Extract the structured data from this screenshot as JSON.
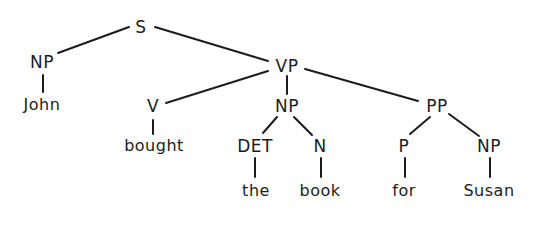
{
  "diagram": {
    "type": "parse-tree",
    "nodes": [
      {
        "id": "S",
        "label": "S",
        "x": 141,
        "y": 27,
        "kind": "category"
      },
      {
        "id": "NP1",
        "label": "NP",
        "x": 42,
        "y": 62,
        "kind": "category"
      },
      {
        "id": "John",
        "label": "John",
        "x": 42,
        "y": 105,
        "kind": "word"
      },
      {
        "id": "VP",
        "label": "VP",
        "x": 287,
        "y": 66,
        "kind": "category"
      },
      {
        "id": "V",
        "label": "V",
        "x": 153,
        "y": 106,
        "kind": "category"
      },
      {
        "id": "bought",
        "label": "bought",
        "x": 154,
        "y": 146,
        "kind": "word"
      },
      {
        "id": "NP2",
        "label": "NP",
        "x": 287,
        "y": 106,
        "kind": "category"
      },
      {
        "id": "DET",
        "label": "DET",
        "x": 255,
        "y": 146,
        "kind": "category"
      },
      {
        "id": "the",
        "label": "the",
        "x": 256,
        "y": 191,
        "kind": "word"
      },
      {
        "id": "N",
        "label": "N",
        "x": 320,
        "y": 146,
        "kind": "category"
      },
      {
        "id": "book",
        "label": "book",
        "x": 320,
        "y": 191,
        "kind": "word"
      },
      {
        "id": "PP",
        "label": "PP",
        "x": 437,
        "y": 106,
        "kind": "category"
      },
      {
        "id": "P",
        "label": "P",
        "x": 404,
        "y": 146,
        "kind": "category"
      },
      {
        "id": "for",
        "label": "for",
        "x": 404,
        "y": 191,
        "kind": "word"
      },
      {
        "id": "NP3",
        "label": "NP",
        "x": 489,
        "y": 146,
        "kind": "category"
      },
      {
        "id": "Susan",
        "label": "Susan",
        "x": 489,
        "y": 191,
        "kind": "word"
      }
    ],
    "edges": [
      {
        "from": "S",
        "to": "NP1",
        "x1": 129,
        "y1": 27,
        "x2": 58,
        "y2": 53
      },
      {
        "from": "S",
        "to": "VP",
        "x1": 155,
        "y1": 27,
        "x2": 268,
        "y2": 61
      },
      {
        "from": "NP1",
        "to": "John",
        "x1": 43,
        "y1": 75,
        "x2": 43,
        "y2": 92
      },
      {
        "from": "VP",
        "to": "V",
        "x1": 268,
        "y1": 71,
        "x2": 166,
        "y2": 103
      },
      {
        "from": "VP",
        "to": "NP2",
        "x1": 287,
        "y1": 76,
        "x2": 287,
        "y2": 94
      },
      {
        "from": "VP",
        "to": "PP",
        "x1": 305,
        "y1": 69,
        "x2": 418,
        "y2": 101
      },
      {
        "from": "V",
        "to": "bought",
        "x1": 153,
        "y1": 120,
        "x2": 153,
        "y2": 134
      },
      {
        "from": "NP2",
        "to": "DET",
        "x1": 277,
        "y1": 117,
        "x2": 263,
        "y2": 133
      },
      {
        "from": "NP2",
        "to": "N",
        "x1": 294,
        "y1": 117,
        "x2": 312,
        "y2": 135
      },
      {
        "from": "DET",
        "to": "the",
        "x1": 255,
        "y1": 158,
        "x2": 255,
        "y2": 177
      },
      {
        "from": "N",
        "to": "book",
        "x1": 321,
        "y1": 158,
        "x2": 321,
        "y2": 177
      },
      {
        "from": "PP",
        "to": "P",
        "x1": 430,
        "y1": 117,
        "x2": 410,
        "y2": 134
      },
      {
        "from": "PP",
        "to": "NP3",
        "x1": 449,
        "y1": 114,
        "x2": 479,
        "y2": 136
      },
      {
        "from": "P",
        "to": "for",
        "x1": 405,
        "y1": 158,
        "x2": 405,
        "y2": 177
      },
      {
        "from": "NP3",
        "to": "Susan",
        "x1": 490,
        "y1": 158,
        "x2": 490,
        "y2": 177
      }
    ],
    "colors": {
      "ink": "#1c1c1c",
      "background": "#ffffff"
    }
  }
}
